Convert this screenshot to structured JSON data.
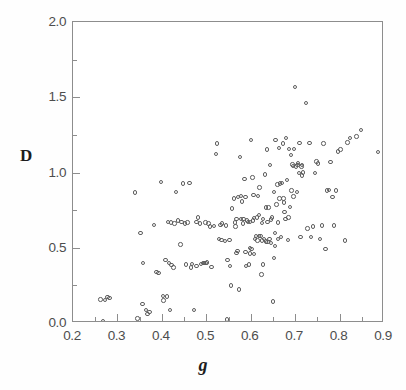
{
  "chart_data": {
    "type": "scatter",
    "title": "",
    "xlabel": "g",
    "ylabel": "D",
    "xlim": [
      0.2,
      0.9
    ],
    "ylim": [
      0.0,
      2.0
    ],
    "grid": false,
    "legend": null,
    "x_ticks": [
      "0.2",
      "0.3",
      "0.4",
      "0.5",
      "0.6",
      "0.7",
      "0.8",
      "0.9"
    ],
    "x_tick_values": [
      0.2,
      0.3,
      0.4,
      0.5,
      0.6,
      0.7,
      0.8,
      0.9
    ],
    "x_minor_tick_values": [
      0.25,
      0.35,
      0.45,
      0.55,
      0.65,
      0.75,
      0.85
    ],
    "y_ticks": [
      "0.0",
      "0.5",
      "1.0",
      "1.5",
      "2.0"
    ],
    "y_tick_values": [
      0.0,
      0.5,
      1.0,
      1.5,
      2.0
    ],
    "y_minor_tick_values": [
      0.25,
      0.75,
      1.25,
      1.75
    ],
    "annotations": [
      {
        "id": "regression-equation",
        "text": "D = 1.47g - 0.163",
        "prefix": "D = 1.47",
        "italic_var": "g",
        "suffix": " - 0.163"
      },
      {
        "id": "correlation",
        "text": "r_gD = +.60",
        "symbol": "r",
        "subscript": "gD",
        "value": " = +.60"
      }
    ],
    "marker": {
      "shape": "open-circle",
      "size_px": 4.4,
      "edge_color": "#5e5e5e",
      "face_color": "none"
    },
    "n_points": 192,
    "points": [
      [
        0.262,
        0.155
      ],
      [
        0.268,
        0.013
      ],
      [
        0.272,
        0.152
      ],
      [
        0.278,
        0.172
      ],
      [
        0.282,
        0.168
      ],
      [
        0.34,
        0.868
      ],
      [
        0.345,
        0.03
      ],
      [
        0.352,
        0.6
      ],
      [
        0.356,
        0.128
      ],
      [
        0.358,
        0.4
      ],
      [
        0.364,
        0.085
      ],
      [
        0.368,
        0.06
      ],
      [
        0.372,
        0.072
      ],
      [
        0.382,
        0.65
      ],
      [
        0.388,
        0.34
      ],
      [
        0.392,
        0.332
      ],
      [
        0.398,
        0.935
      ],
      [
        0.402,
        0.178
      ],
      [
        0.404,
        0.15
      ],
      [
        0.408,
        0.42
      ],
      [
        0.412,
        0.175
      ],
      [
        0.414,
        0.672
      ],
      [
        0.416,
        0.398
      ],
      [
        0.418,
        0.088
      ],
      [
        0.42,
        0.668
      ],
      [
        0.422,
        0.386
      ],
      [
        0.426,
        0.37
      ],
      [
        0.432,
        0.872
      ],
      [
        0.436,
        0.68
      ],
      [
        0.442,
        0.522
      ],
      [
        0.448,
        0.928
      ],
      [
        0.452,
        0.66
      ],
      [
        0.454,
        0.39
      ],
      [
        0.458,
        0.668
      ],
      [
        0.462,
        0.932
      ],
      [
        0.466,
        0.368
      ],
      [
        0.472,
        0.088
      ],
      [
        0.478,
        0.672
      ],
      [
        0.482,
        0.702
      ],
      [
        0.486,
        0.662
      ],
      [
        0.492,
        0.398
      ],
      [
        0.495,
        0.399
      ],
      [
        0.498,
        0.4
      ],
      [
        0.502,
        0.402
      ],
      [
        0.505,
        0.66
      ],
      [
        0.508,
        0.64
      ],
      [
        0.512,
        0.372
      ],
      [
        0.518,
        0.646
      ],
      [
        0.522,
        1.125
      ],
      [
        0.524,
        1.192
      ],
      [
        0.528,
        0.56
      ],
      [
        0.532,
        0.65
      ],
      [
        0.536,
        0.662
      ],
      [
        0.542,
        0.545
      ],
      [
        0.546,
        0.024
      ],
      [
        0.548,
        0.418
      ],
      [
        0.552,
        0.552
      ],
      [
        0.556,
        0.248
      ],
      [
        0.558,
        0.76
      ],
      [
        0.562,
        0.828
      ],
      [
        0.566,
        0.64
      ],
      [
        0.568,
        0.465
      ],
      [
        0.57,
        0.478
      ],
      [
        0.572,
        0.836
      ],
      [
        0.574,
        0.222
      ],
      [
        0.576,
        1.105
      ],
      [
        0.578,
        0.845
      ],
      [
        0.582,
        0.66
      ],
      [
        0.584,
        0.69
      ],
      [
        0.586,
        0.958
      ],
      [
        0.588,
        0.838
      ],
      [
        0.59,
        0.378
      ],
      [
        0.592,
        0.68
      ],
      [
        0.594,
        0.672
      ],
      [
        0.596,
        0.39
      ],
      [
        0.598,
        0.498
      ],
      [
        0.6,
        1.218
      ],
      [
        0.602,
        0.492
      ],
      [
        0.604,
        0.968
      ],
      [
        0.606,
        0.852
      ],
      [
        0.608,
        0.698
      ],
      [
        0.61,
        0.56
      ],
      [
        0.612,
        0.58
      ],
      [
        0.614,
        0.7
      ],
      [
        0.616,
        0.842
      ],
      [
        0.618,
        0.718
      ],
      [
        0.62,
        0.9
      ],
      [
        0.622,
        0.58
      ],
      [
        0.624,
        0.322
      ],
      [
        0.626,
        0.665
      ],
      [
        0.628,
        0.388
      ],
      [
        0.63,
        0.56
      ],
      [
        0.632,
        0.988
      ],
      [
        0.634,
        0.768
      ],
      [
        0.636,
        1.152
      ],
      [
        0.638,
        0.54
      ],
      [
        0.64,
        0.768
      ],
      [
        0.642,
        0.56
      ],
      [
        0.644,
        1.048
      ],
      [
        0.646,
        0.532
      ],
      [
        0.648,
        0.7
      ],
      [
        0.65,
        0.142
      ],
      [
        0.652,
        0.43
      ],
      [
        0.654,
        0.598
      ],
      [
        0.656,
        1.218
      ],
      [
        0.658,
        0.788
      ],
      [
        0.66,
        0.92
      ],
      [
        0.662,
        0.668
      ],
      [
        0.664,
        1.162
      ],
      [
        0.666,
        0.928
      ],
      [
        0.668,
        0.572
      ],
      [
        0.67,
        0.93
      ],
      [
        0.672,
        1.192
      ],
      [
        0.674,
        0.828
      ],
      [
        0.676,
        0.738
      ],
      [
        0.678,
        0.692
      ],
      [
        0.68,
        1.23
      ],
      [
        0.682,
        0.95
      ],
      [
        0.684,
        0.552
      ],
      [
        0.686,
        1.158
      ],
      [
        0.688,
        0.772
      ],
      [
        0.69,
        1.118
      ],
      [
        0.692,
        0.88
      ],
      [
        0.694,
        1.052
      ],
      [
        0.696,
        0.84
      ],
      [
        0.698,
        1.158
      ],
      [
        0.7,
        1.57
      ],
      [
        0.702,
        1.04
      ],
      [
        0.704,
        0.87
      ],
      [
        0.706,
        1.062
      ],
      [
        0.708,
        0.998
      ],
      [
        0.71,
        1.198
      ],
      [
        0.712,
        0.57
      ],
      [
        0.714,
        1.04
      ],
      [
        0.716,
        0.98
      ],
      [
        0.718,
        1.0
      ],
      [
        0.724,
        1.462
      ],
      [
        0.728,
        0.628
      ],
      [
        0.732,
        1.198
      ],
      [
        0.736,
        0.572
      ],
      [
        0.74,
        0.64
      ],
      [
        0.744,
        0.998
      ],
      [
        0.748,
        1.072
      ],
      [
        0.752,
        1.06
      ],
      [
        0.756,
        0.56
      ],
      [
        0.76,
        0.648
      ],
      [
        0.764,
        1.192
      ],
      [
        0.768,
        0.492
      ],
      [
        0.772,
        0.88
      ],
      [
        0.776,
        0.882
      ],
      [
        0.78,
        1.07
      ],
      [
        0.784,
        0.838
      ],
      [
        0.788,
        0.648
      ],
      [
        0.792,
        0.88
      ],
      [
        0.796,
        1.14
      ],
      [
        0.802,
        1.152
      ],
      [
        0.812,
        0.548
      ],
      [
        0.818,
        1.2
      ],
      [
        0.824,
        1.23
      ],
      [
        0.838,
        1.24
      ],
      [
        0.848,
        1.282
      ],
      [
        0.886,
        1.135
      ],
      [
        0.428,
        0.66
      ],
      [
        0.444,
        0.672
      ],
      [
        0.534,
        0.552
      ],
      [
        0.544,
        0.648
      ],
      [
        0.554,
        0.378
      ],
      [
        0.564,
        0.668
      ],
      [
        0.58,
        0.808
      ],
      [
        0.598,
        0.672
      ],
      [
        0.605,
        0.68
      ],
      [
        0.615,
        0.548
      ],
      [
        0.625,
        0.548
      ],
      [
        0.635,
        0.542
      ],
      [
        0.645,
        0.688
      ],
      [
        0.655,
        0.512
      ],
      [
        0.665,
        0.828
      ],
      [
        0.675,
        0.802
      ],
      [
        0.685,
        0.7
      ],
      [
        0.695,
        1.042
      ],
      [
        0.705,
        1.048
      ],
      [
        0.715,
        1.048
      ],
      [
        0.598,
        0.462
      ],
      [
        0.608,
        0.46
      ],
      [
        0.588,
        0.47
      ],
      [
        0.578,
        0.69
      ],
      [
        0.568,
        0.69
      ],
      [
        0.618,
        0.578
      ],
      [
        0.628,
        0.692
      ],
      [
        0.638,
        0.672
      ],
      [
        0.652,
        0.87
      ],
      [
        0.662,
        0.558
      ],
      [
        0.498,
        0.668
      ],
      [
        0.488,
        0.392
      ],
      [
        0.478,
        0.378
      ],
      [
        0.468,
        0.392
      ]
    ]
  }
}
